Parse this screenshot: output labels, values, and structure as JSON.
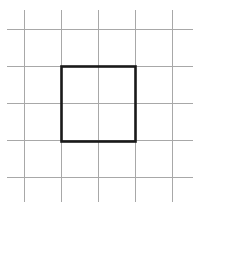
{
  "figure": {
    "kind": "geometry-figure",
    "canvas": {
      "width": 230,
      "height": 259
    },
    "background_color": "#ffffff"
  },
  "grid": {
    "line_color": "#a8a8a8",
    "line_width": 1,
    "cell_size": 37,
    "columns": 5,
    "rows": 5,
    "vertical_lines_x": [
      24.5,
      61.5,
      98.5,
      135.5,
      172.5
    ],
    "horizontal_lines_y": [
      29.5,
      66.5,
      103.5,
      140.5,
      177.5
    ],
    "vertical_span_y": [
      10,
      202
    ],
    "horizontal_span_x": [
      7,
      193
    ]
  },
  "shape": {
    "name": "square",
    "stroke_color": "#1a1a1a",
    "stroke_width": 2.6,
    "fill": "none",
    "x": 61.5,
    "y": 66.5,
    "width": 74,
    "height": 75,
    "cells_wide": 2,
    "cells_tall": 2,
    "corners": [
      {
        "label": "top-left",
        "x": 61.5,
        "y": 66.5
      },
      {
        "label": "top-right",
        "x": 135.5,
        "y": 66.5
      },
      {
        "label": "bottom-right",
        "x": 135.5,
        "y": 141.5
      },
      {
        "label": "bottom-left",
        "x": 61.5,
        "y": 141.5
      }
    ]
  },
  "caption": {
    "text": ""
  }
}
